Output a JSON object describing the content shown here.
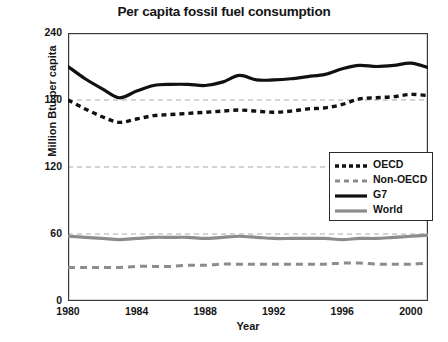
{
  "chart_data": {
    "type": "line",
    "title": "Per capita fossil fuel consumption",
    "xlabel": "Year",
    "ylabel": "Million Btu per capita",
    "xlim": [
      1980,
      2001
    ],
    "ylim": [
      0,
      240
    ],
    "y_ticks": [
      0,
      60,
      120,
      180,
      240
    ],
    "y_tick_labels": [
      "0",
      "60",
      "120",
      "180",
      "240"
    ],
    "x_ticks": [
      1980,
      1982,
      1984,
      1986,
      1988,
      1990,
      1992,
      1994,
      1996,
      1998,
      2000
    ],
    "x_tick_labels": [
      "1980",
      "",
      "1984",
      "",
      "1988",
      "",
      "1992",
      "",
      "1996",
      "",
      "2000"
    ],
    "x_labeled_ticks": [
      1980,
      1984,
      1988,
      1992,
      1996,
      2000
    ],
    "grid": "horizontal-dashed-gray",
    "legend_position": "middle-right",
    "x": [
      1980,
      1981,
      1982,
      1983,
      1984,
      1985,
      1986,
      1987,
      1988,
      1989,
      1990,
      1991,
      1992,
      1993,
      1994,
      1995,
      1996,
      1997,
      1998,
      1999,
      2000,
      2001
    ],
    "series": [
      {
        "name": "OECD",
        "style": "dashed",
        "color": "#111111",
        "width": 3.4,
        "values": [
          180,
          172,
          165,
          160,
          163,
          166,
          167,
          168,
          169,
          170,
          171,
          170,
          169,
          170,
          172,
          173,
          176,
          181,
          182,
          183,
          185,
          184
        ]
      },
      {
        "name": "Non-OECD",
        "style": "dashed",
        "color": "#8c8c8c",
        "width": 3.0,
        "values": [
          30,
          30,
          30,
          30,
          31,
          31,
          31,
          32,
          32,
          33,
          33,
          33,
          33,
          33,
          33,
          33,
          34,
          34,
          33,
          33,
          33,
          34
        ]
      },
      {
        "name": "G7",
        "style": "solid",
        "color": "#111111",
        "width": 3.2,
        "values": [
          210,
          199,
          190,
          182,
          188,
          193,
          194,
          194,
          193,
          196,
          202,
          198,
          198,
          199,
          201,
          203,
          208,
          211,
          210,
          211,
          213,
          209
        ]
      },
      {
        "name": "World",
        "style": "solid",
        "color": "#8c8c8c",
        "width": 3.2,
        "values": [
          58,
          57,
          56,
          55,
          56,
          57,
          57,
          57,
          56,
          57,
          58,
          57,
          56,
          56,
          56,
          56,
          55,
          56,
          56,
          57,
          58,
          59
        ]
      }
    ]
  },
  "legend": {
    "items": [
      {
        "label": "OECD"
      },
      {
        "label": "Non-OECD"
      },
      {
        "label": "G7"
      },
      {
        "label": "World"
      }
    ]
  },
  "colors": {
    "axis": "#3c3c3c",
    "grid": "#a8a8a8",
    "dark_series": "#111111",
    "gray_series": "#8c8c8c",
    "text": "#141414"
  }
}
